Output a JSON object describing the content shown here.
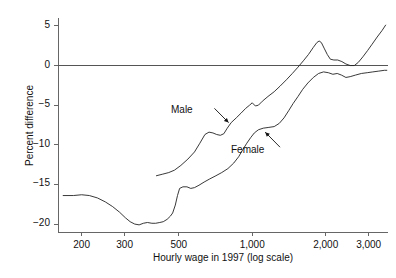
{
  "chart_data": {
    "type": "line",
    "title": "",
    "subtitle": "",
    "xlabel": "Hourly wage in 1997 (log scale)",
    "ylabel": "Percent difference",
    "x_scale": "log",
    "xlim": [
      160,
      3600
    ],
    "ylim": [
      -21,
      6
    ],
    "grid": false,
    "legend_position": "inline-annotations",
    "x_ticks": [
      {
        "value": 200,
        "label": "200"
      },
      {
        "value": 300,
        "label": "300"
      },
      {
        "value": 500,
        "label": "500"
      },
      {
        "value": 1000,
        "label": "1,000"
      },
      {
        "value": 2000,
        "label": "2,000"
      },
      {
        "value": 3000,
        "label": "3,000"
      }
    ],
    "y_ticks": [
      {
        "value": 5,
        "label": "5"
      },
      {
        "value": 0,
        "label": "0"
      },
      {
        "value": -5,
        "label": "−5"
      },
      {
        "value": -10,
        "label": "−10"
      },
      {
        "value": -15,
        "label": "−15"
      },
      {
        "value": -20,
        "label": "−20"
      }
    ],
    "reference_lines": [
      {
        "axis": "y",
        "value": 0,
        "color": "#555555"
      }
    ],
    "series": [
      {
        "name": "Male",
        "color": "#222222",
        "label_text": "Male",
        "annotation_arrow": true,
        "points": [
          [
            405,
            -13.9
          ],
          [
            430,
            -13.7
          ],
          [
            455,
            -13.5
          ],
          [
            480,
            -13.2
          ],
          [
            510,
            -12.6
          ],
          [
            545,
            -11.8
          ],
          [
            580,
            -10.9
          ],
          [
            610,
            -9.8
          ],
          [
            640,
            -8.7
          ],
          [
            665,
            -8.4
          ],
          [
            690,
            -8.5
          ],
          [
            715,
            -8.7
          ],
          [
            740,
            -8.8
          ],
          [
            765,
            -8.6
          ],
          [
            790,
            -7.9
          ],
          [
            820,
            -7.2
          ],
          [
            860,
            -6.6
          ],
          [
            900,
            -6.0
          ],
          [
            940,
            -5.4
          ],
          [
            975,
            -5.0
          ],
          [
            1000,
            -4.7
          ],
          [
            1030,
            -5.1
          ],
          [
            1060,
            -5.0
          ],
          [
            1100,
            -4.5
          ],
          [
            1160,
            -3.9
          ],
          [
            1230,
            -3.3
          ],
          [
            1300,
            -2.6
          ],
          [
            1380,
            -1.8
          ],
          [
            1460,
            -1.0
          ],
          [
            1540,
            -0.2
          ],
          [
            1620,
            0.6
          ],
          [
            1700,
            1.4
          ],
          [
            1780,
            2.3
          ],
          [
            1840,
            2.9
          ],
          [
            1880,
            3.1
          ],
          [
            1920,
            2.9
          ],
          [
            1970,
            2.2
          ],
          [
            2030,
            1.4
          ],
          [
            2090,
            0.8
          ],
          [
            2160,
            0.7
          ],
          [
            2240,
            0.7
          ],
          [
            2330,
            0.5
          ],
          [
            2420,
            0.2
          ],
          [
            2520,
            0.0
          ],
          [
            2620,
            0.0
          ],
          [
            2720,
            0.4
          ],
          [
            2840,
            1.1
          ],
          [
            2970,
            1.9
          ],
          [
            3100,
            2.7
          ],
          [
            3250,
            3.6
          ],
          [
            3400,
            4.4
          ],
          [
            3520,
            5.1
          ]
        ]
      },
      {
        "name": "Female",
        "color": "#222222",
        "label_text": "Female",
        "annotation_arrow": true,
        "points": [
          [
            168,
            -16.4
          ],
          [
            185,
            -16.4
          ],
          [
            200,
            -16.3
          ],
          [
            215,
            -16.4
          ],
          [
            232,
            -16.7
          ],
          [
            250,
            -17.2
          ],
          [
            268,
            -17.8
          ],
          [
            286,
            -18.5
          ],
          [
            302,
            -19.2
          ],
          [
            316,
            -19.7
          ],
          [
            330,
            -20.0
          ],
          [
            344,
            -20.1
          ],
          [
            358,
            -19.9
          ],
          [
            372,
            -19.8
          ],
          [
            388,
            -19.9
          ],
          [
            402,
            -19.9
          ],
          [
            418,
            -19.8
          ],
          [
            432,
            -19.7
          ],
          [
            448,
            -19.4
          ],
          [
            462,
            -19.0
          ],
          [
            472,
            -18.6
          ],
          [
            484,
            -17.6
          ],
          [
            494,
            -16.4
          ],
          [
            504,
            -15.5
          ],
          [
            520,
            -15.3
          ],
          [
            540,
            -15.3
          ],
          [
            560,
            -15.5
          ],
          [
            580,
            -15.4
          ],
          [
            605,
            -15.1
          ],
          [
            635,
            -14.7
          ],
          [
            670,
            -14.3
          ],
          [
            710,
            -13.9
          ],
          [
            750,
            -13.5
          ],
          [
            795,
            -13.0
          ],
          [
            840,
            -12.3
          ],
          [
            880,
            -11.5
          ],
          [
            915,
            -10.6
          ],
          [
            950,
            -9.8
          ],
          [
            985,
            -9.1
          ],
          [
            1020,
            -8.5
          ],
          [
            1060,
            -8.1
          ],
          [
            1110,
            -7.9
          ],
          [
            1170,
            -7.8
          ],
          [
            1230,
            -7.7
          ],
          [
            1290,
            -7.3
          ],
          [
            1350,
            -6.6
          ],
          [
            1410,
            -5.7
          ],
          [
            1470,
            -4.8
          ],
          [
            1540,
            -3.9
          ],
          [
            1610,
            -3.0
          ],
          [
            1690,
            -2.2
          ],
          [
            1780,
            -1.5
          ],
          [
            1870,
            -1.0
          ],
          [
            1960,
            -0.8
          ],
          [
            2050,
            -0.9
          ],
          [
            2140,
            -1.1
          ],
          [
            2230,
            -1.0
          ],
          [
            2320,
            -1.2
          ],
          [
            2420,
            -1.5
          ],
          [
            2520,
            -1.4
          ],
          [
            2650,
            -1.2
          ],
          [
            2800,
            -1.0
          ],
          [
            2960,
            -0.9
          ],
          [
            3120,
            -0.8
          ],
          [
            3300,
            -0.7
          ],
          [
            3480,
            -0.6
          ],
          [
            3560,
            -0.6
          ]
        ]
      }
    ],
    "annotations": [
      {
        "text": "Male",
        "arrow_from": [
          700,
          -5.4
        ],
        "arrow_to": [
          800,
          -7.2
        ]
      },
      {
        "text": "Female",
        "arrow_from": [
          1300,
          -10.3
        ],
        "arrow_to": [
          1130,
          -8.4
        ]
      }
    ]
  },
  "axis_titles": {
    "x": "Hourly wage in 1997 (log scale)",
    "y": "Percent difference"
  }
}
